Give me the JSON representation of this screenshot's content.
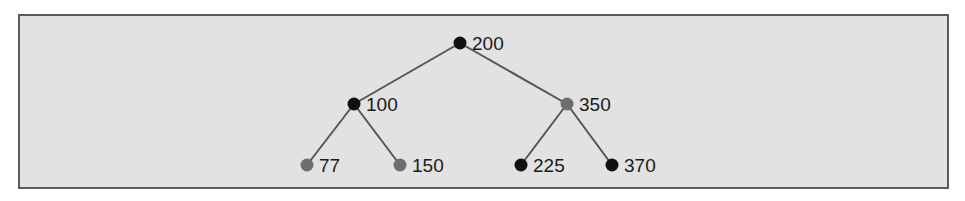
{
  "diagram": {
    "type": "binary-search-tree",
    "colors": {
      "background": "#e2e2e2",
      "border": "#5a5a5a",
      "edge": "#555555",
      "black_node": "#111111",
      "gray_node": "#6e6e6e",
      "label": "#1a1a1a"
    },
    "nodes": [
      {
        "id": "n200",
        "label": "200",
        "x": 460,
        "y": 43,
        "color": "black"
      },
      {
        "id": "n100",
        "label": "100",
        "x": 354,
        "y": 104,
        "color": "black"
      },
      {
        "id": "n350",
        "label": "350",
        "x": 567,
        "y": 104,
        "color": "gray"
      },
      {
        "id": "n77",
        "label": "77",
        "x": 307,
        "y": 165,
        "color": "gray"
      },
      {
        "id": "n150",
        "label": "150",
        "x": 400,
        "y": 165,
        "color": "gray"
      },
      {
        "id": "n225",
        "label": "225",
        "x": 521,
        "y": 165,
        "color": "black"
      },
      {
        "id": "n370",
        "label": "370",
        "x": 612,
        "y": 165,
        "color": "black"
      }
    ],
    "edges": [
      {
        "from": "n200",
        "to": "n100"
      },
      {
        "from": "n200",
        "to": "n350"
      },
      {
        "from": "n100",
        "to": "n77"
      },
      {
        "from": "n100",
        "to": "n150"
      },
      {
        "from": "n350",
        "to": "n225"
      },
      {
        "from": "n350",
        "to": "n370"
      }
    ]
  }
}
